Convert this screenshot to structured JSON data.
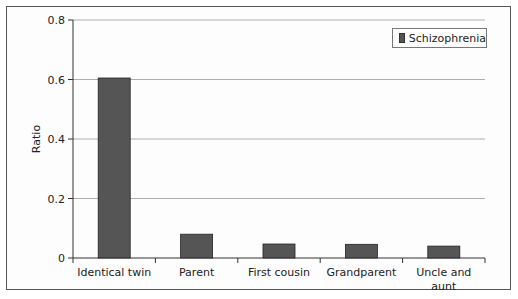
{
  "chart_data": {
    "type": "bar",
    "title": "",
    "xlabel": "",
    "ylabel": "Ratio",
    "ylim": [
      0,
      0.8
    ],
    "yticks": [
      "0",
      "0.2",
      "0.4",
      "0.6",
      "0.8"
    ],
    "grid": true,
    "legend_position": "top-right",
    "categories": [
      "Identical twin",
      "Parent",
      "First cousin",
      "Grandparent",
      "Uncle and aunt"
    ],
    "series": [
      {
        "name": "Schizophrenia",
        "color": "#555555",
        "values": [
          0.605,
          0.08,
          0.047,
          0.046,
          0.04
        ]
      }
    ]
  },
  "legend": {
    "label": "Schizophrenia"
  },
  "axis": {
    "ylabel": "Ratio"
  }
}
